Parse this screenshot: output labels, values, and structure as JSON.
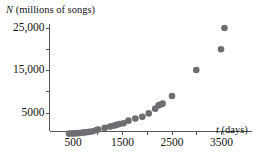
{
  "chart_data": {
    "type": "scatter",
    "title": "",
    "subtitle": "",
    "xlabel": "t (days)",
    "ylabel": "N (millions of songs)",
    "xlabel_symbol": "t",
    "xlabel_unit": "(days)",
    "ylabel_symbol": "N",
    "ylabel_unit": "(millions of songs)",
    "xlim": [
      0,
      3800
    ],
    "ylim": [
      0,
      27000
    ],
    "xticks": [
      500,
      1500,
      2500,
      3500
    ],
    "xtick_labels": [
      "500",
      "1500",
      "2500",
      "3500"
    ],
    "xminor_ticks": [
      1000,
      2000,
      3000
    ],
    "yticks": [
      5000,
      15000,
      25000
    ],
    "ytick_labels": [
      "5000",
      "15,000",
      "25,000"
    ],
    "yminor_ticks": [
      10000,
      20000
    ],
    "grid": false,
    "legend": false,
    "marker": "circle",
    "marker_color": "#6e6e72",
    "marker_size": 3.3,
    "axis_color": "#55555a",
    "series": [
      {
        "name": "songs downloaded",
        "points": [
          [
            420,
            150
          ],
          [
            470,
            170
          ],
          [
            520,
            200
          ],
          [
            560,
            230
          ],
          [
            600,
            260
          ],
          [
            640,
            300
          ],
          [
            680,
            340
          ],
          [
            720,
            400
          ],
          [
            760,
            460
          ],
          [
            800,
            520
          ],
          [
            840,
            600
          ],
          [
            900,
            700
          ],
          [
            975,
            1000
          ],
          [
            1010,
            1100
          ],
          [
            1140,
            1500
          ],
          [
            1250,
            1800
          ],
          [
            1320,
            2000
          ],
          [
            1380,
            2200
          ],
          [
            1440,
            2400
          ],
          [
            1520,
            2600
          ],
          [
            1620,
            3200
          ],
          [
            1760,
            3700
          ],
          [
            1900,
            4100
          ],
          [
            2030,
            4900
          ],
          [
            2160,
            6000
          ],
          [
            2230,
            6800
          ],
          [
            2270,
            7000
          ],
          [
            2310,
            7200
          ],
          [
            2500,
            9000
          ],
          [
            2990,
            15100
          ],
          [
            3490,
            20000
          ],
          [
            3560,
            25000
          ]
        ]
      }
    ]
  },
  "axes": {
    "x_axis_name": "x-axis",
    "y_axis_name": "y-axis"
  }
}
